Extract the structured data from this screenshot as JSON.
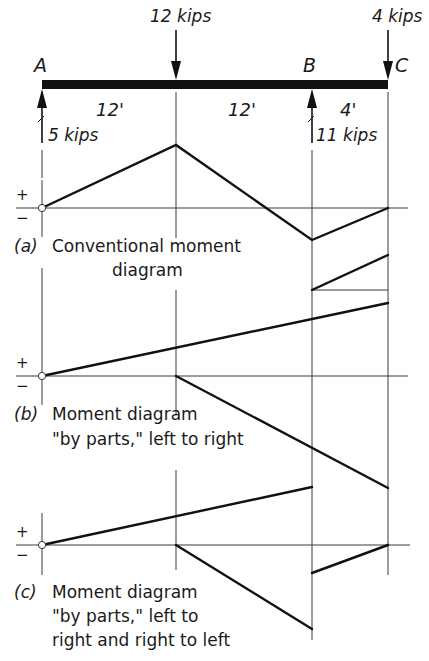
{
  "beam": {
    "points": [
      {
        "name": "A",
        "label": "A"
      },
      {
        "name": "B",
        "label": "B"
      },
      {
        "name": "C",
        "label": "C"
      }
    ],
    "loads": [
      {
        "label": "12 kips",
        "direction": "down",
        "position": "midspan AB"
      },
      {
        "label": "4 kips",
        "direction": "down",
        "position": "C"
      }
    ],
    "reactions": [
      {
        "label": "5 kips",
        "direction": "up",
        "position": "A"
      },
      {
        "label": "11 kips",
        "direction": "up",
        "position": "B"
      }
    ],
    "spans": [
      "12'",
      "12'",
      "4'"
    ]
  },
  "signs": {
    "plus": "+",
    "minus": "−"
  },
  "diagrams": {
    "a": {
      "tag": "(a)",
      "line1": "Conventional moment",
      "line2": "diagram"
    },
    "b": {
      "tag": "(b)",
      "line1": "Moment diagram",
      "line2": "\"by parts,\" left to right"
    },
    "c": {
      "tag": "(c)",
      "line1": "Moment diagram",
      "line2": "\"by parts,\" left to",
      "line3": "right and right to left"
    }
  }
}
